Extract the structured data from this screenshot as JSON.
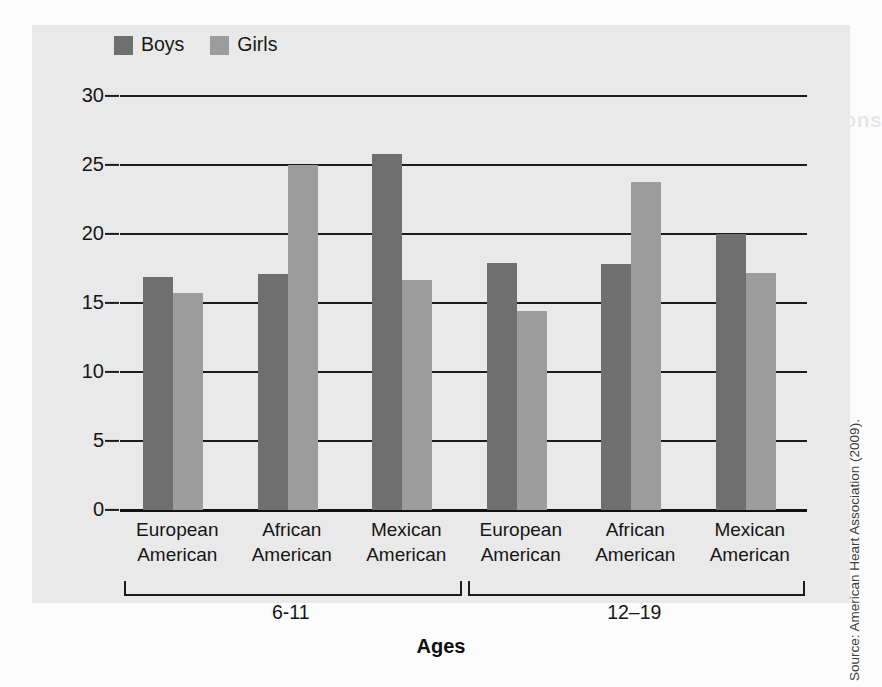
{
  "legend": {
    "items": [
      {
        "label": "Boys",
        "color": "#6f6f6f"
      },
      {
        "label": "Girls",
        "color": "#9c9c9c"
      }
    ]
  },
  "axis_title": "Ages",
  "source_note": "Source: American Heart Association (2009).",
  "ghost_text": {
    "right_block": "Summary and Conclusions"
  },
  "chart_data": {
    "type": "bar",
    "title": "",
    "xlabel": "Ages",
    "ylabel": "",
    "ylim": [
      0,
      30
    ],
    "yticks": [
      0,
      5,
      10,
      15,
      20,
      25,
      30
    ],
    "ytick_labels": [
      "0",
      "5",
      "10",
      "15",
      "20",
      "25",
      "30"
    ],
    "grid": true,
    "legend_position": "top-left",
    "categories": [
      "European American",
      "African American",
      "Mexican American",
      "European American",
      "African American",
      "Mexican American"
    ],
    "category_lines": [
      [
        "European",
        "American"
      ],
      [
        "African",
        "American"
      ],
      [
        "Mexican",
        "American"
      ],
      [
        "European",
        "American"
      ],
      [
        "African",
        "American"
      ],
      [
        "Mexican",
        "American"
      ]
    ],
    "groups": [
      {
        "label": "6-11",
        "category_indices": [
          0,
          1,
          2
        ]
      },
      {
        "label": "12–19",
        "category_indices": [
          3,
          4,
          5
        ]
      }
    ],
    "series": [
      {
        "name": "Boys",
        "color": "#6f6f6f",
        "values": [
          16.9,
          17.1,
          25.8,
          17.9,
          17.8,
          20.0
        ]
      },
      {
        "name": "Girls",
        "color": "#9c9c9c",
        "values": [
          15.7,
          25.0,
          16.7,
          14.4,
          23.8,
          17.2
        ]
      }
    ],
    "source": "American Heart Association (2009)."
  }
}
